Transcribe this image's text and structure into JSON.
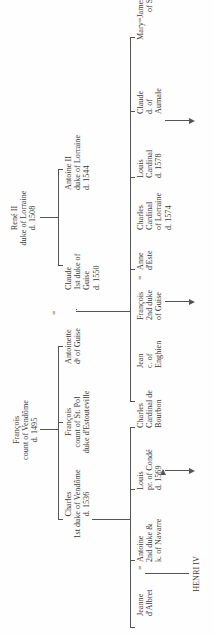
{
  "roots": [
    {
      "id": "francois-vendome",
      "lines": [
        "François",
        "count of Vendôme",
        "d. 1495"
      ]
    },
    {
      "id": "rene-ii",
      "lines": [
        "René II",
        "duke of Lorraine",
        "d. 1508"
      ]
    }
  ],
  "generation1": [
    {
      "id": "charles-vendome",
      "lines": [
        "Charles",
        "1st duke of Vendôme",
        "d. 1536"
      ]
    },
    {
      "id": "francois-st-pol",
      "lines": [
        "François",
        "count of St. Pol",
        "duke d'Estouteville"
      ]
    },
    {
      "id": "antoinette",
      "lines": [
        "Antoinette",
        "dˢ of Guise"
      ]
    },
    {
      "id": "claude-guise",
      "lines": [
        "Claude",
        "1st duke of",
        "Guise",
        "d. 1550"
      ]
    },
    {
      "id": "antoine-ii",
      "lines": [
        "Antoine II",
        "duke of Lorraine",
        "d. 1544"
      ]
    }
  ],
  "generation2": [
    {
      "id": "antoine-navarre",
      "lines": [
        "Antoine",
        "2nd duke &",
        "k. of Navarre"
      ]
    },
    {
      "id": "louis-conde",
      "lines": [
        "Louis",
        "pr. of Condé",
        "d. 1569"
      ]
    },
    {
      "id": "charles-bourbon",
      "lines": [
        "Charles",
        "Cardinal de",
        "Bourbon"
      ]
    },
    {
      "id": "jean-enghien",
      "lines": [
        "Jean",
        "c. of",
        "Enghien"
      ]
    },
    {
      "id": "francois-guise",
      "lines": [
        "François",
        "2nd duke",
        "of Guise"
      ]
    },
    {
      "id": "charles-lorraine",
      "lines": [
        "Charles",
        "Cardinal",
        "of Lorraine",
        "d. 1574"
      ]
    },
    {
      "id": "louis-cardinal",
      "lines": [
        "Louis",
        "Cardinal",
        "d. 1578"
      ]
    },
    {
      "id": "claude-aumale",
      "lines": [
        "Claude",
        "d. of",
        "Aumale"
      ]
    },
    {
      "id": "mary",
      "lines": [
        "Mary"
      ]
    }
  ],
  "spouses": [
    {
      "id": "jeanne-albret",
      "lines": [
        "Jeanne",
        "d'Albret"
      ]
    },
    {
      "id": "anne-este",
      "lines": [
        "Anne",
        "d'Este"
      ]
    },
    {
      "id": "james-v",
      "lines": [
        "James V",
        "of Scotland"
      ]
    }
  ],
  "marriage_symbol": "=",
  "generation3": [
    {
      "id": "henri-iv",
      "lines": [
        "HENRI IV"
      ]
    }
  ]
}
